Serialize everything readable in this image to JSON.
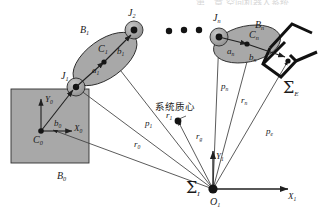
{
  "figure": {
    "caption_fragment_top": "第二章 空间机器人系统",
    "annotations": {
      "system_com": "系统质心"
    },
    "bodies": [
      {
        "name": "base_body_label",
        "text": "B",
        "sub": "0"
      },
      {
        "name": "link1_label",
        "text": "B",
        "sub": "1"
      },
      {
        "name": "linkn_label",
        "text": "B",
        "sub": "n"
      }
    ],
    "joints": [
      {
        "name": "joint1_label",
        "text": "J",
        "sub": "1"
      },
      {
        "name": "joint2_label",
        "text": "J",
        "sub": "2"
      },
      {
        "name": "jointn_label",
        "text": "J",
        "sub": "n"
      }
    ],
    "centroids": [
      {
        "name": "base_centroid_label",
        "text": "C",
        "sub": "0"
      },
      {
        "name": "link1_centroid_label",
        "text": "C",
        "sub": "1"
      },
      {
        "name": "linkn_centroid_label",
        "text": "C",
        "sub": "n"
      }
    ],
    "base_frame_axes": [
      {
        "name": "base_axis_x",
        "text": "X",
        "sub": "0"
      },
      {
        "name": "base_axis_y",
        "text": "Y",
        "sub": "0"
      }
    ],
    "inertial_frame": {
      "symbol": "Σ",
      "symbol_sub": "I",
      "origin": "O",
      "origin_sub": "1",
      "axis_x": "X",
      "axis_x_sub": "1",
      "axis_y": "Y",
      "axis_y_sub": "1"
    },
    "end_effector_frame": {
      "symbol": "Σ",
      "symbol_sub": "E"
    },
    "link_vectors": [
      {
        "name": "vector-a1",
        "text": "a",
        "sub": "1"
      },
      {
        "name": "vector-b1",
        "text": "b",
        "sub": "1"
      },
      {
        "name": "vector-an",
        "text": "a",
        "sub": "n"
      },
      {
        "name": "vector-bn",
        "text": "b",
        "sub": "n"
      },
      {
        "name": "vector-b0",
        "text": "b",
        "sub": "0"
      }
    ],
    "position_vectors": [
      {
        "name": "vector-r0",
        "text": "r",
        "sub": "0"
      },
      {
        "name": "vector-p1",
        "text": "p",
        "sub": "1"
      },
      {
        "name": "vector-r1",
        "text": "r",
        "sub": "1"
      },
      {
        "name": "vector-rg",
        "text": "r",
        "sub": "g"
      },
      {
        "name": "vector-pn",
        "text": "p",
        "sub": "n"
      },
      {
        "name": "vector-rn",
        "text": "r",
        "sub": "n"
      },
      {
        "name": "vector-pe",
        "text": "p",
        "sub": "e"
      }
    ],
    "colors": {
      "body_fill": "#a8a8a8",
      "body_stroke": "#2b2b2b",
      "line": "#3a3a3a",
      "gripper": "#111111",
      "text": "#1a1a1a"
    }
  }
}
